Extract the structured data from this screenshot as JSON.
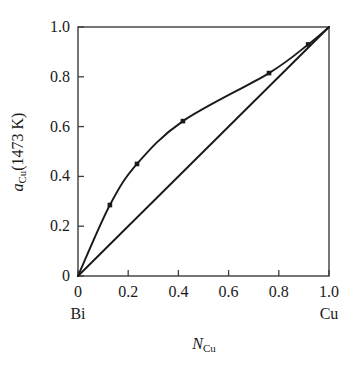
{
  "chart_data": {
    "type": "line",
    "title": "",
    "subtitle": "",
    "xlabel": "N_Cu",
    "xlabel_symbol": "N",
    "xlabel_subscript": "Cu",
    "ylabel": "a_Cu(1473 K)",
    "ylabel_symbol": "a",
    "ylabel_subscript": "Cu",
    "ylabel_suffix": "(1473 K)",
    "xlim": [
      0,
      1.0
    ],
    "ylim": [
      0,
      1.0
    ],
    "grid": false,
    "legend": "none",
    "xticks": [
      "0",
      "0.2",
      "0.4",
      "0.6",
      "0.8",
      "1.0"
    ],
    "xtick_values": [
      0,
      0.2,
      0.4,
      0.6,
      0.8,
      1.0
    ],
    "yticks": [
      "0",
      "0.2",
      "0.4",
      "0.6",
      "0.8",
      "1.0"
    ],
    "ytick_values": [
      0,
      0.2,
      0.4,
      0.6,
      0.8,
      1.0
    ],
    "x_endpoint_left": "Bi",
    "x_endpoint_right": "Cu",
    "line_color": "#1a1a1a",
    "marker_color": "#1a1a1a",
    "axis_color": "#3c3c3c",
    "series": [
      {
        "name": "activity of Cu",
        "marker": "square",
        "x": [
          0,
          0.127,
          0.235,
          0.418,
          0.761,
          0.917,
          1.0
        ],
        "values": [
          0,
          0.285,
          0.45,
          0.622,
          0.815,
          0.93,
          1.0
        ]
      },
      {
        "name": "Raoult's law ideal line",
        "marker": "none",
        "x": [
          0,
          1.0
        ],
        "values": [
          0,
          1.0
        ]
      }
    ]
  }
}
